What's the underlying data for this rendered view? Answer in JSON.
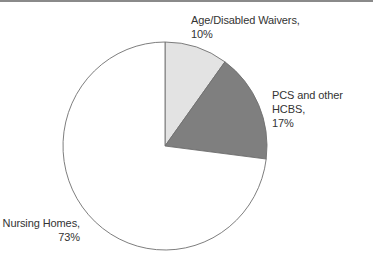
{
  "chart_data": {
    "type": "pie",
    "title": "",
    "categories": [
      "Age/Disabled Waivers",
      "PCS and other HCBS",
      "Nursing Homes"
    ],
    "values": [
      10,
      17,
      73
    ],
    "unit": "%",
    "start_angle_deg": 0,
    "direction": "clockwise",
    "colors": [
      "#e3e3e3",
      "#7f7f7f",
      "#ffffff"
    ],
    "labels": [
      {
        "name": "Age/Disabled Waivers,",
        "value": "10%"
      },
      {
        "name": "PCS and other HCBS,",
        "value": "17%"
      },
      {
        "name": "Nursing Homes,",
        "value": "73%"
      }
    ],
    "legend": "none (direct labels)"
  }
}
